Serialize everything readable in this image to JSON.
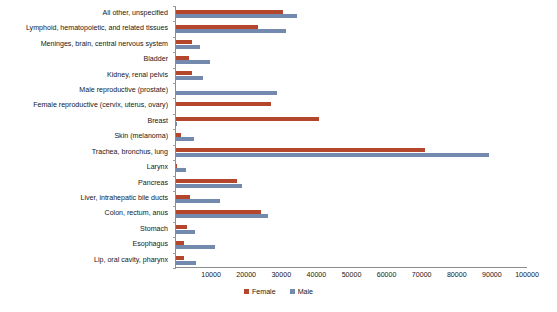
{
  "chart_data": {
    "type": "bar",
    "orientation": "horizontal",
    "title": "",
    "subtitle": "",
    "xlabel": "",
    "ylabel": "",
    "xlim": [
      0,
      100000
    ],
    "ylim": null,
    "grid": false,
    "legend_position": "bottom-center",
    "xticks": [
      0,
      10000,
      20000,
      30000,
      40000,
      50000,
      60000,
      70000,
      80000,
      90000,
      100000
    ],
    "xtick_labels": [
      "",
      "10000",
      "20000",
      "30000",
      "40000",
      "50000",
      "60000",
      "70000",
      "80000",
      "90000",
      "100000"
    ],
    "categories": [
      "All other, unspecified",
      "Lymphoid, hematopoietic, and related tissues",
      "Meninges, brain, central nervous system",
      "Bladder",
      "Kidney, renal pelvis",
      "Male reproductive (prostate)",
      "Female reproductive (cervix, uterus, ovary)",
      "Breast",
      "Skin (melanoma)",
      "Trachea, bronchus, lung",
      "Larynx",
      "Pancreas",
      "Liver, intrahepatic bile ducts",
      "Colon, rectum, anus",
      "Stomach",
      "Esophagus",
      "Lip, oral cavity, pharynx"
    ],
    "series": [
      {
        "name": "Female",
        "color": "#b4472b",
        "values": [
          30400,
          23300,
          4600,
          3700,
          4600,
          0,
          27100,
          40700,
          1400,
          70900,
          400,
          17400,
          4000,
          24200,
          3100,
          2300,
          2300
        ]
      },
      {
        "name": "Male",
        "color": "#7389ad",
        "values": [
          34500,
          31300,
          6800,
          9700,
          7700,
          28800,
          0,
          400,
          5100,
          89200,
          2800,
          18800,
          12500,
          26200,
          5400,
          11100,
          5700
        ]
      }
    ]
  },
  "legend": {
    "items": [
      {
        "label": "Female",
        "color": "#b4472b"
      },
      {
        "label": "Male",
        "color": "#7389ad"
      }
    ]
  }
}
